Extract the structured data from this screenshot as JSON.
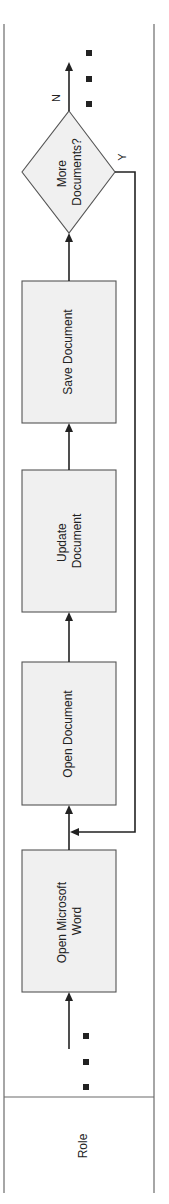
{
  "diagram": {
    "orientation": "rotated-90-ccw",
    "lane": {
      "role_label": "Role"
    },
    "steps": [
      {
        "id": "open-word",
        "lines": [
          "Open Microsoft",
          "Word"
        ]
      },
      {
        "id": "open-doc",
        "lines": [
          "Open Document"
        ]
      },
      {
        "id": "update-doc",
        "lines": [
          "Update",
          "Document"
        ]
      },
      {
        "id": "save-doc",
        "lines": [
          "Save Document"
        ]
      }
    ],
    "decision": {
      "lines": [
        "More",
        "Documents?"
      ],
      "yes_label": "Y",
      "no_label": "N"
    },
    "continuation_marks": {
      "start": "■ ■ ■",
      "end": "■ ■ ■"
    },
    "colors": {
      "box_fill": "#f0f0f0",
      "box_stroke": "#555555",
      "line": "#222222",
      "lane": "#6b6b6b"
    }
  }
}
